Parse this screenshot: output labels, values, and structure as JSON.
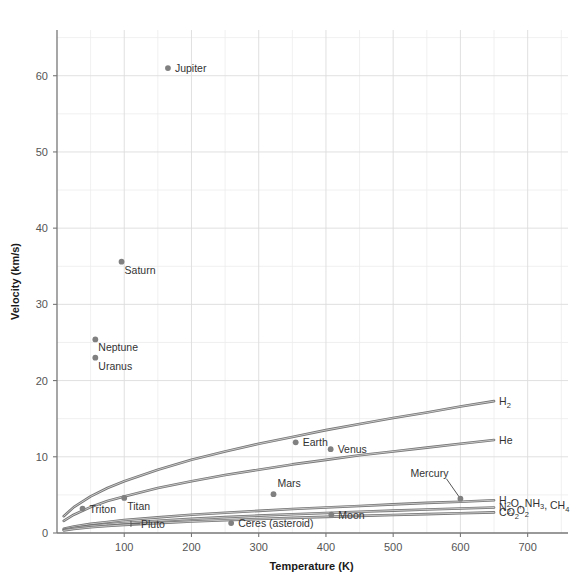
{
  "chart_data": {
    "type": "scatter",
    "title": "",
    "xlabel": "Temperature (K)",
    "ylabel": "Velocity (km/s)",
    "xlim": [
      0,
      760
    ],
    "ylim": [
      0,
      66
    ],
    "xticks": [
      100,
      200,
      300,
      400,
      500,
      600,
      700
    ],
    "yticks": [
      0,
      10,
      20,
      30,
      40,
      50,
      60
    ],
    "xtick_labels": [
      "100",
      "200",
      "300",
      "400",
      "500",
      "600",
      "700"
    ],
    "ytick_labels": [
      "0",
      "10",
      "20",
      "30",
      "40",
      "50",
      "60"
    ],
    "grid": true,
    "minor_grid": true,
    "legend": "none",
    "point_color": "#808080",
    "curve_color": "#6e6e6e",
    "grid_color": "#dcdcdc",
    "axis_color": "#777777",
    "points": [
      {
        "name": "Jupiter",
        "x": 165,
        "y": 61.0,
        "label": "Jupiter",
        "label_pos": "right"
      },
      {
        "name": "Saturn",
        "x": 96,
        "y": 35.6,
        "label": "Saturn",
        "label_pos": "below-right"
      },
      {
        "name": "Neptune",
        "x": 57,
        "y": 25.4,
        "label": "Neptune",
        "label_pos": "below-right"
      },
      {
        "name": "Uranus",
        "x": 57,
        "y": 23.0,
        "label": "Uranus",
        "label_pos": "below-right"
      },
      {
        "name": "Earth",
        "x": 355,
        "y": 11.9,
        "label": "Earth",
        "label_pos": "right"
      },
      {
        "name": "Venus",
        "x": 407,
        "y": 11.0,
        "label": "Venus",
        "label_pos": "right"
      },
      {
        "name": "Mars",
        "x": 322,
        "y": 5.1,
        "label": "Mars",
        "label_pos": "above-right"
      },
      {
        "name": "Mercury",
        "x": 600,
        "y": 4.5,
        "label": "Mercury",
        "label_pos": "leader-up-left"
      },
      {
        "name": "Titan",
        "x": 100,
        "y": 4.6,
        "label": "Titan",
        "label_pos": "below-right"
      },
      {
        "name": "Triton",
        "x": 38,
        "y": 3.2,
        "label": "Triton",
        "label_pos": "right"
      },
      {
        "name": "Moon",
        "x": 408,
        "y": 2.4,
        "label": "Moon",
        "label_pos": "right"
      },
      {
        "name": "Ceres (asteroid)",
        "x": 259,
        "y": 1.3,
        "label": "Ceres (asteroid)",
        "label_pos": "right"
      },
      {
        "name": "Pluto",
        "x": 110,
        "y": 1.2,
        "label": "Pluto",
        "label_pos": "tick-right"
      }
    ],
    "series": [
      {
        "name": "H2",
        "label_main": "H",
        "label_sub": "2",
        "label_text": "H2",
        "x": [
          10,
          25,
          50,
          75,
          100,
          150,
          200,
          250,
          300,
          350,
          400,
          450,
          500,
          550,
          600,
          650
        ],
        "y": [
          2.2,
          3.4,
          4.8,
          5.9,
          6.8,
          8.3,
          9.6,
          10.7,
          11.7,
          12.6,
          13.5,
          14.3,
          15.1,
          15.8,
          16.6,
          17.3
        ]
      },
      {
        "name": "He",
        "label_main": "He",
        "label_sub": "",
        "label_text": "He",
        "x": [
          10,
          25,
          50,
          75,
          100,
          150,
          200,
          250,
          300,
          350,
          400,
          450,
          500,
          550,
          600,
          650
        ],
        "y": [
          1.6,
          2.4,
          3.4,
          4.2,
          4.8,
          5.9,
          6.8,
          7.6,
          8.3,
          9.0,
          9.6,
          10.2,
          10.7,
          11.2,
          11.7,
          12.2
        ]
      },
      {
        "name": "H2O, NH3, CH4",
        "label_main": "H",
        "label_sub": "2",
        "label_text": "H2O, NH3, CH4",
        "x": [
          10,
          25,
          50,
          75,
          100,
          150,
          200,
          250,
          300,
          350,
          400,
          450,
          500,
          550,
          600,
          650
        ],
        "y": [
          0.55,
          0.85,
          1.2,
          1.45,
          1.7,
          2.05,
          2.4,
          2.65,
          2.9,
          3.15,
          3.35,
          3.55,
          3.75,
          3.95,
          4.1,
          4.3
        ]
      },
      {
        "name": "N2, O2",
        "label_main": "N",
        "label_sub": "2",
        "label_text": "N2, O2",
        "x": [
          10,
          25,
          50,
          75,
          100,
          150,
          200,
          250,
          300,
          350,
          400,
          450,
          500,
          550,
          600,
          650
        ],
        "y": [
          0.42,
          0.66,
          0.93,
          1.14,
          1.32,
          1.61,
          1.86,
          2.08,
          2.28,
          2.46,
          2.63,
          2.79,
          2.94,
          3.08,
          3.22,
          3.35
        ]
      },
      {
        "name": "CO2",
        "label_main": "CO",
        "label_sub": "2",
        "label_text": "CO2",
        "x": [
          10,
          25,
          50,
          75,
          100,
          150,
          200,
          250,
          300,
          350,
          400,
          450,
          500,
          550,
          600,
          650
        ],
        "y": [
          0.34,
          0.53,
          0.75,
          0.92,
          1.06,
          1.3,
          1.5,
          1.68,
          1.84,
          1.98,
          2.12,
          2.25,
          2.37,
          2.48,
          2.6,
          2.7
        ]
      }
    ],
    "curve_labels": [
      {
        "name": "H2",
        "main": "H",
        "sub": "2",
        "rest": "",
        "y_value": 17.3
      },
      {
        "name": "He",
        "main": "He",
        "sub": "",
        "rest": "",
        "y_value": 12.2
      },
      {
        "name": "H2O, NH3, CH4",
        "main": "H",
        "sub": "2",
        "rest": "O, NH",
        "y_value": 4.3
      },
      {
        "name": "N2, O2",
        "main": "N",
        "sub": "2",
        "rest": ", O",
        "y_value": 3.35
      },
      {
        "name": "CO2",
        "main": "CO",
        "sub": "2",
        "rest": "",
        "y_value": 2.7
      }
    ]
  }
}
